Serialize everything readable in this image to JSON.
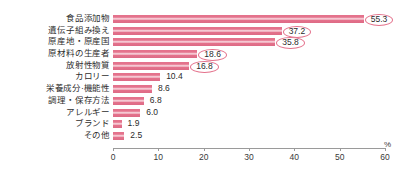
{
  "chart_data": {
    "type": "bar",
    "orientation": "horizontal",
    "title": "",
    "xlabel": "%",
    "ylabel": "",
    "xlim": [
      0,
      60
    ],
    "xticks": [
      0,
      10,
      20,
      30,
      40,
      50,
      60
    ],
    "grid": false,
    "legend": null,
    "bar_color": "#e4728c",
    "categories": [
      "食品添加物",
      "遺伝子組み換え",
      "原産地・原産国",
      "原材料の生産者",
      "放射性物質",
      "カロリー",
      "栄養成分·機能性",
      "調理・保存方法",
      "アレルギー",
      "ブランド",
      "その他"
    ],
    "values": [
      55.3,
      37.2,
      35.8,
      18.6,
      16.8,
      10.4,
      8.6,
      6.8,
      6.0,
      1.9,
      2.5
    ],
    "label_style": [
      "circled",
      "circled",
      "circled",
      "circled",
      "circled",
      "plain",
      "plain",
      "plain",
      "plain",
      "plain",
      "plain"
    ]
  },
  "axis": {
    "unit_label": "%",
    "tick_labels": [
      "0",
      "10",
      "20",
      "30",
      "40",
      "50",
      "60"
    ]
  }
}
